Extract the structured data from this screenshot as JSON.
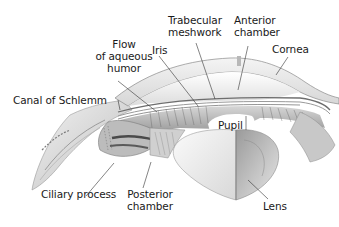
{
  "diagram": {
    "labels": {
      "flow": [
        "Flow",
        "of aqueous",
        "humor"
      ],
      "iris": "Iris",
      "trabecular": [
        "Trabecular",
        "meshwork"
      ],
      "anterior": [
        "Anterior",
        "chamber"
      ],
      "cornea": "Cornea",
      "canal": "Canal of Schlemm",
      "pupil": "Pupil",
      "ciliary": "Ciliary process",
      "posterior": [
        "Posterior",
        "chamber"
      ],
      "lens": "Lens"
    },
    "colors": {
      "background": "#ffffff",
      "text": "#1a1a1a",
      "leader_line": "#333333",
      "tissue_light": "#e6e6e6",
      "tissue_mid": "#b5b5b5",
      "tissue_dark": "#6e6e6e"
    }
  }
}
